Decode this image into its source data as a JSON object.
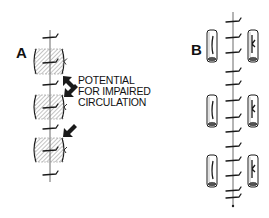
{
  "figure": {
    "panels": [
      {
        "id": "A",
        "label": "A",
        "annotation_lines": [
          "POTENTIAL",
          "FOR IMPAIRED",
          "CIRCULATION"
        ],
        "axis_x": 50,
        "axis_y_range": [
          30,
          182
        ],
        "segments": [
          {
            "y": 49,
            "h": 25
          },
          {
            "y": 95,
            "h": 24
          },
          {
            "y": 138,
            "h": 24
          }
        ],
        "ticks_y": [
          37,
          62,
          84,
          107,
          128,
          150,
          174
        ],
        "arrows": [
          {
            "tip_x": 63,
            "tip_y": 76,
            "dir": "up-left"
          },
          {
            "tip_x": 64,
            "tip_y": 97,
            "dir": "down-left"
          },
          {
            "tip_x": 63,
            "tip_y": 137,
            "dir": "down-left"
          }
        ]
      },
      {
        "id": "B",
        "label": "B",
        "axis_x": 233,
        "axis_y_range": [
          12,
          206
        ],
        "cylinder_pairs": [
          {
            "y": 30,
            "h": 32
          },
          {
            "y": 95,
            "h": 32
          },
          {
            "y": 155,
            "h": 32
          }
        ],
        "ticks_y": [
          21,
          37,
          52,
          71,
          84,
          100,
          117,
          131,
          146,
          160,
          175,
          190,
          197
        ]
      }
    ],
    "colors": {
      "ink": "#1a1a1a",
      "hatch": "#6a6a6a",
      "axis": "#444444",
      "background": "#ffffff"
    }
  }
}
